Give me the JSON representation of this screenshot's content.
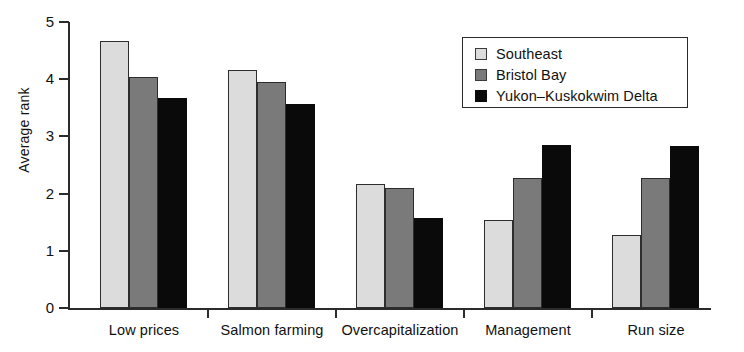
{
  "chart_data": {
    "type": "bar",
    "title": "",
    "subtitle": "",
    "xlabel": "",
    "ylabel": "Average rank",
    "ylim": [
      0,
      5
    ],
    "yticks": [
      0,
      1,
      2,
      3,
      4,
      5
    ],
    "ytick_labels": [
      "0",
      "1",
      "2",
      "3",
      "4",
      "5"
    ],
    "grid": false,
    "legend_position": "top-right",
    "categories": [
      "Low prices",
      "Salmon farming",
      "Overcapitalization",
      "Management",
      "Run size"
    ],
    "series": [
      {
        "name": "Southeast",
        "color": "#dcdcdc",
        "values": [
          4.67,
          4.16,
          2.17,
          1.53,
          1.28
        ]
      },
      {
        "name": "Bristol Bay",
        "color": "#7a7a7a",
        "values": [
          4.03,
          3.95,
          2.1,
          2.28,
          2.27
        ]
      },
      {
        "name": "Yukon–Kuskokwim Delta",
        "color": "#0a0a0a",
        "values": [
          3.68,
          3.57,
          1.57,
          2.85,
          2.84
        ]
      }
    ]
  },
  "axes": {
    "y_title": "Average rank"
  },
  "legend": {
    "entries": [
      {
        "label": "Southeast",
        "color": "#dcdcdc"
      },
      {
        "label": "Bristol Bay",
        "color": "#7a7a7a"
      },
      {
        "label": "Yukon–Kuskokwim Delta",
        "color": "#0a0a0a"
      }
    ]
  },
  "colors": {
    "series_light": "#dcdcdc",
    "series_medium": "#7a7a7a",
    "series_dark": "#0a0a0a",
    "axis": "#2b2b2b",
    "background": "#ffffff"
  }
}
